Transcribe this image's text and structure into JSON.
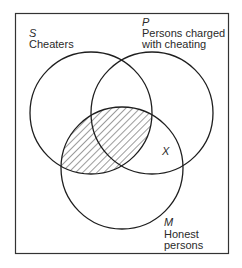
{
  "diagram": {
    "type": "venn",
    "frame": {
      "x": 15,
      "y": 13,
      "width": 214,
      "height": 241
    },
    "circles": [
      {
        "id": "S",
        "letter": "S",
        "label_lines": [
          "Cheaters"
        ],
        "cx": 91,
        "cy": 113,
        "r": 61
      },
      {
        "id": "P",
        "letter": "P",
        "label_lines": [
          "Persons charged",
          "with cheating"
        ],
        "cx": 152,
        "cy": 113,
        "r": 61
      },
      {
        "id": "M",
        "letter": "M",
        "label_lines": [
          "Honest",
          "persons"
        ],
        "cx": 122,
        "cy": 168,
        "r": 61
      }
    ],
    "shaded_region": "S ∩ M (hatched)",
    "marker": {
      "letter": "X",
      "region": "P ∩ M outside S"
    },
    "labels": {
      "s_letter": "S",
      "s_line1": "Cheaters",
      "p_letter": "P",
      "p_line1": "Persons charged",
      "p_line2": "with cheating",
      "m_letter": "M",
      "m_line1": "Honest",
      "m_line2": "persons",
      "x_marker": "X"
    },
    "colors": {
      "stroke": "#1e1e1e",
      "hatch": "#3a3a3a",
      "background": "#ffffff"
    }
  }
}
